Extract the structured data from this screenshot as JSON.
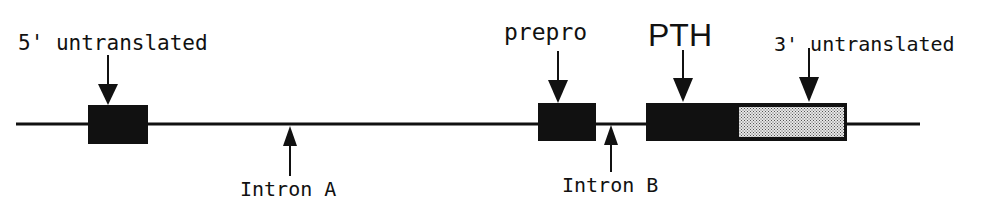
{
  "diagram": {
    "title": "",
    "colors": {
      "line": "#111111",
      "exon": "#111111",
      "stipple": "#cfcfcf",
      "background": "#ffffff"
    },
    "labels": {
      "utr5": "5' untranslated",
      "prepro": "prepro",
      "pth": "PTH",
      "utr3": "3' untranslated",
      "intron_a": "Intron A",
      "intron_b": "Intron B"
    },
    "elements": [
      {
        "id": "utr5",
        "type": "exon",
        "label": "5' untranslated",
        "fill": "solid"
      },
      {
        "id": "intron_a",
        "type": "intron",
        "label": "Intron A"
      },
      {
        "id": "prepro",
        "type": "exon",
        "label": "prepro",
        "fill": "solid"
      },
      {
        "id": "intron_b",
        "type": "intron",
        "label": "Intron B"
      },
      {
        "id": "pth",
        "type": "exon",
        "label": "PTH",
        "fill": "solid"
      },
      {
        "id": "utr3",
        "type": "exon",
        "label": "3' untranslated",
        "fill": "stippled"
      }
    ]
  }
}
